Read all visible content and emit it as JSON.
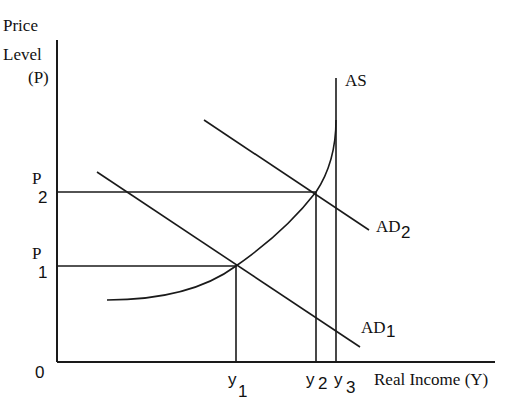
{
  "diagram": {
    "type": "AD-AS economics diagram",
    "y_axis": {
      "label_line1": "Price",
      "label_line2": "Level",
      "label_line3": "(P)"
    },
    "x_axis": {
      "label": "Real Income (Y)"
    },
    "origin_label": "0",
    "price_levels": [
      {
        "base": "P",
        "sub": "1"
      },
      {
        "base": "P",
        "sub": "2"
      }
    ],
    "income_levels": [
      {
        "base": "y",
        "sub": "1"
      },
      {
        "base": "y",
        "sub": "2"
      },
      {
        "base": "y",
        "sub": "3"
      }
    ],
    "curves": {
      "as": {
        "label": "AS"
      },
      "ad1": {
        "base": "AD",
        "sub": "1"
      },
      "ad2": {
        "base": "AD",
        "sub": "2"
      }
    },
    "equilibria": [
      {
        "name": "E1",
        "price": "P1",
        "income": "y1",
        "curve": "AD1"
      },
      {
        "name": "E2",
        "price": "P2",
        "income": "y2",
        "curve": "AD2"
      }
    ],
    "full_employment_income": "y3"
  }
}
